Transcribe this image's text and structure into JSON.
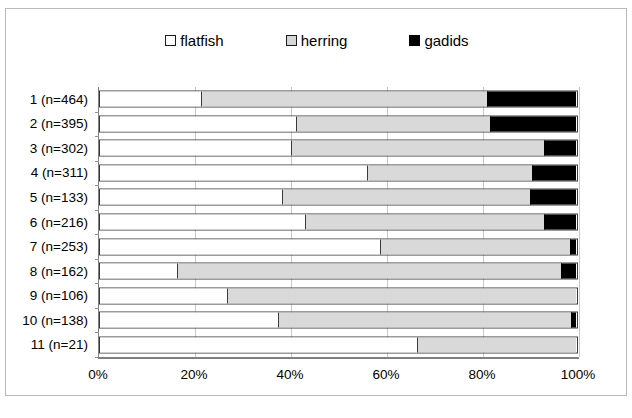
{
  "chart_data": {
    "type": "bar",
    "orientation": "horizontal",
    "stacked": true,
    "normalized_percent": true,
    "title": "",
    "xlabel": "",
    "ylabel": "",
    "xlim": [
      0,
      100
    ],
    "xtick_labels": [
      "0%",
      "20%",
      "40%",
      "60%",
      "80%",
      "100%"
    ],
    "xticks": [
      0,
      20,
      40,
      60,
      80,
      100
    ],
    "grid": true,
    "legend_position": "top-center",
    "legend": [
      "flatfish",
      "herring",
      "gadids"
    ],
    "categories": [
      "1 (n=464)",
      "2 (n=395)",
      "3 (n=302)",
      "4 (n=311)",
      "5 (n=133)",
      "6 (n=216)",
      "7 (n=253)",
      "8 (n=162)",
      "9 (n=106)",
      "10 (n=138)",
      "11 (n=21)"
    ],
    "series": [
      {
        "name": "flatfish",
        "color": "#ffffff",
        "values": [
          21.5,
          41.3,
          40.4,
          56.3,
          38.5,
          43.3,
          59.0,
          16.5,
          26.9,
          37.5,
          66.7
        ]
      },
      {
        "name": "herring",
        "color": "#d9d9d9",
        "values": [
          60.0,
          40.7,
          52.9,
          34.5,
          51.9,
          50.0,
          39.8,
          80.4,
          73.1,
          61.5,
          33.3
        ]
      },
      {
        "name": "gadids",
        "color": "#000000",
        "values": [
          18.5,
          18.0,
          6.7,
          9.2,
          9.6,
          6.7,
          1.2,
          3.1,
          0.0,
          1.0,
          0.0
        ]
      }
    ]
  },
  "colors": {
    "flatfish": "#ffffff",
    "herring": "#d9d9d9",
    "gadids": "#000000",
    "gridline": "#c8c8c8",
    "axis": "#808080",
    "bar_outline": "#3a3a3a",
    "frame": "#b9b9b9"
  }
}
